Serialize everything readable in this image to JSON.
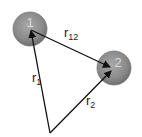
{
  "diagram": {
    "type": "position-vector diagram",
    "bodies": [
      {
        "id": "1",
        "label": "1",
        "cx": 30,
        "cy": 29,
        "r": 17,
        "fill": "#8a8a8a"
      },
      {
        "id": "2",
        "label": "2",
        "cx": 114,
        "cy": 68,
        "r": 17,
        "fill": "#8a8a8a"
      }
    ],
    "origin": {
      "x": 50,
      "y": 133
    },
    "vectors": [
      {
        "name": "r1",
        "base": "r",
        "sub": "1",
        "from": "origin",
        "to": "1"
      },
      {
        "name": "r2",
        "base": "r",
        "sub": "2",
        "from": "origin",
        "to": "2"
      },
      {
        "name": "r12",
        "base": "r",
        "sub": "12",
        "from": "1",
        "to": "2"
      }
    ],
    "labels": {
      "r1": {
        "base": "r",
        "sub": "1"
      },
      "r2": {
        "base": "r",
        "sub": "2"
      },
      "r12": {
        "base": "r",
        "sub": "12"
      }
    },
    "colors": {
      "line": "#1a1a1a",
      "body": "#8a8a8a",
      "background": "#ffffff"
    }
  }
}
